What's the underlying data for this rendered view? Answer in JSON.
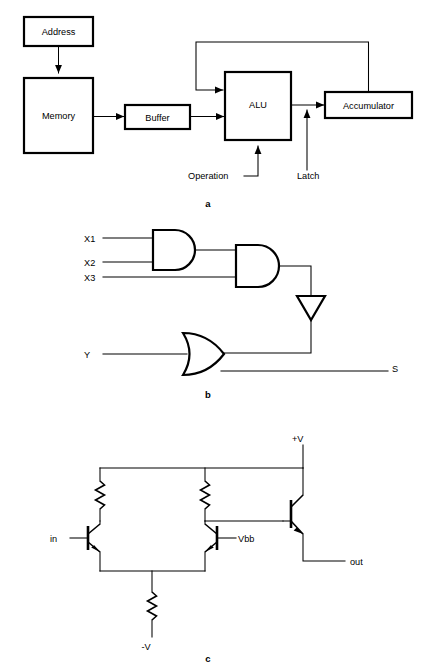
{
  "figure": {
    "background_color": "#ffffff",
    "line_color": "#000000"
  },
  "panel_a": {
    "caption": "a",
    "description": "Block diagram of an arithmetic logic unit datapath",
    "blocks": [
      {
        "id": "address",
        "label": "Address"
      },
      {
        "id": "memory",
        "label": "Memory"
      },
      {
        "id": "buffer",
        "label": "Buffer"
      },
      {
        "id": "alu",
        "label": "ALU"
      },
      {
        "id": "accumulator",
        "label": "Accumulator"
      }
    ],
    "signal_labels": [
      {
        "id": "operation",
        "label": "Operation"
      },
      {
        "id": "latch",
        "label": "Latch"
      }
    ],
    "connections": [
      {
        "from": "Address",
        "to": "Memory"
      },
      {
        "from": "Memory",
        "to": "Buffer"
      },
      {
        "from": "Buffer",
        "to": "ALU"
      },
      {
        "from": "ALU",
        "to": "Accumulator"
      },
      {
        "from": "Accumulator",
        "to": "ALU",
        "kind": "feedback"
      },
      {
        "from": "Operation",
        "to": "ALU"
      },
      {
        "from": "Latch",
        "to": "ALU output bus"
      }
    ]
  },
  "panel_b": {
    "caption": "b",
    "description": "Logic network of two AND gates, an inverter and an OR gate",
    "inputs": [
      {
        "id": "x1",
        "label": "X1"
      },
      {
        "id": "x2",
        "label": "X2"
      },
      {
        "id": "x3",
        "label": "X3"
      },
      {
        "id": "y",
        "label": "Y"
      }
    ],
    "outputs": [
      {
        "id": "s",
        "label": "S"
      }
    ],
    "gates": [
      {
        "id": "and1",
        "type": "AND",
        "inputs": [
          "X1",
          "X2"
        ]
      },
      {
        "id": "and2",
        "type": "AND",
        "inputs": [
          "and1",
          "X3"
        ]
      },
      {
        "id": "inv1",
        "type": "NOT",
        "inputs": [
          "and2"
        ]
      },
      {
        "id": "or1",
        "type": "OR",
        "inputs": [
          "Y",
          "inv1"
        ],
        "output": "S"
      }
    ]
  },
  "panel_c": {
    "caption": "c",
    "description": "Emitter coupled differential pair with emitter follower output",
    "supply_labels": [
      {
        "id": "vplus",
        "label": "+V"
      },
      {
        "id": "vminus",
        "label": "-V"
      }
    ],
    "terminal_labels": [
      {
        "id": "in",
        "label": "in"
      },
      {
        "id": "vbb",
        "label": "Vbb"
      },
      {
        "id": "out",
        "label": "out"
      }
    ],
    "components": [
      {
        "id": "rc1",
        "type": "resistor",
        "note": "left collector load"
      },
      {
        "id": "rc2",
        "type": "resistor",
        "note": "right collector load"
      },
      {
        "id": "re",
        "type": "resistor",
        "note": "tail resistor to -V"
      },
      {
        "id": "q1",
        "type": "npn-transistor",
        "note": "left input transistor, base = in"
      },
      {
        "id": "q2",
        "type": "npn-transistor",
        "note": "right reference transistor, base = Vbb"
      },
      {
        "id": "q3",
        "type": "npn-transistor",
        "note": "emitter follower, emitter = out"
      }
    ]
  }
}
